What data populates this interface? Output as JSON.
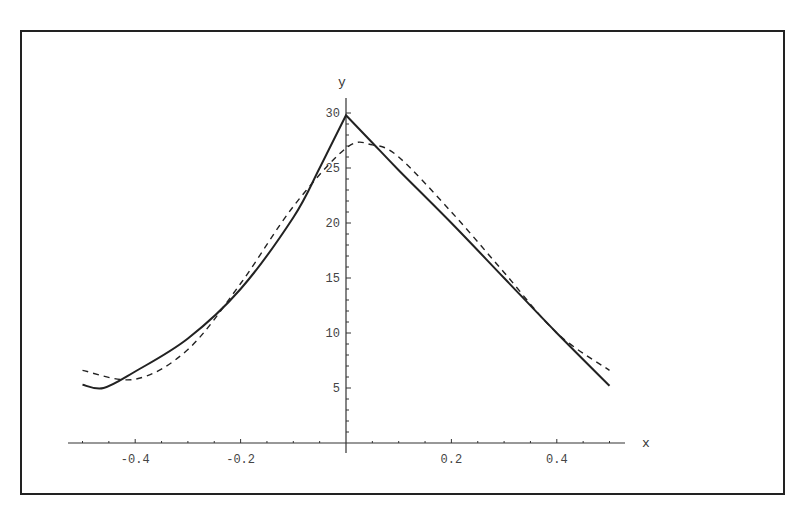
{
  "chart_data": {
    "type": "line",
    "title": "",
    "xlabel": "x",
    "ylabel": "y",
    "xlim": [
      -0.5,
      0.5
    ],
    "ylim": [
      0,
      30
    ],
    "grid": false,
    "legend": null,
    "x_ticks": [
      -0.4,
      -0.2,
      0.2,
      0.4
    ],
    "x_tick_labels": [
      "-0.4",
      "-0.2",
      "0.2",
      "0.4"
    ],
    "y_ticks": [
      5,
      10,
      15,
      20,
      25,
      30
    ],
    "y_tick_labels": [
      "5",
      "10",
      "15",
      "20",
      "25",
      "30"
    ],
    "series": [
      {
        "name": "solid",
        "style": "solid",
        "x": [
          -0.5,
          -0.46,
          -0.4,
          -0.3,
          -0.2,
          -0.1,
          -0.05,
          0.0,
          0.05,
          0.1,
          0.2,
          0.3,
          0.4,
          0.5
        ],
        "values": [
          5.3,
          5.0,
          6.5,
          9.5,
          14.0,
          20.5,
          25.0,
          29.8,
          27.3,
          24.8,
          20.0,
          15.0,
          10.0,
          5.2
        ]
      },
      {
        "name": "dashed",
        "style": "dashed",
        "x": [
          -0.5,
          -0.4,
          -0.3,
          -0.2,
          -0.1,
          0.0,
          0.05,
          0.1,
          0.2,
          0.3,
          0.4,
          0.5
        ],
        "values": [
          6.6,
          5.8,
          8.5,
          14.5,
          21.5,
          26.8,
          27.1,
          26.0,
          21.0,
          15.5,
          10.0,
          6.6
        ]
      }
    ]
  },
  "axes": {
    "x_label": "x",
    "y_label": "y",
    "x_tick_labels": [
      "-0.4",
      "-0.2",
      "0.2",
      "0.4"
    ],
    "y_tick_labels": [
      "5",
      "10",
      "15",
      "20",
      "25",
      "30"
    ]
  }
}
